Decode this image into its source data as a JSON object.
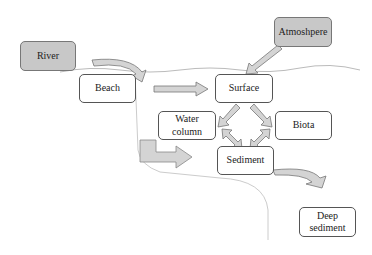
{
  "diagram": {
    "nodes": {
      "river": {
        "label": "River"
      },
      "atmosphere": {
        "label": "Atmoshpere"
      },
      "beach": {
        "label": "Beach"
      },
      "surface": {
        "label": "Surface"
      },
      "water_column": {
        "label": "Water column"
      },
      "biota": {
        "label": "Biota"
      },
      "sediment": {
        "label": "Sediment"
      },
      "deep_sediment": {
        "label": "Deep sediment"
      }
    },
    "colors": {
      "shaded_fill": "#c8c8c8",
      "arrow_fill": "#d4d4d4",
      "border": "#555555",
      "line": "#bbbbbb"
    }
  }
}
